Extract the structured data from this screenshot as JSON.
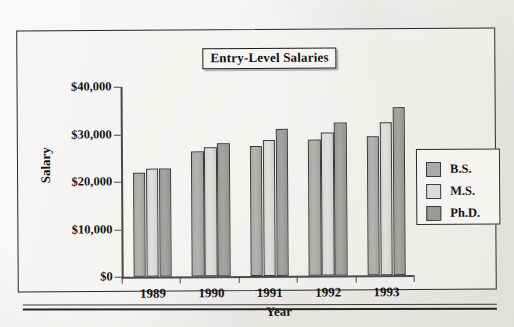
{
  "figure": {
    "title": "Entry-Level Salaries"
  },
  "chart_data": {
    "type": "bar",
    "title": "Entry-Level Salaries",
    "xlabel": "Year",
    "ylabel": "Salary",
    "categories": [
      "1989",
      "1990",
      "1991",
      "1992",
      "1993"
    ],
    "ylim": [
      0,
      40000
    ],
    "ytick_values": [
      0,
      10000,
      20000,
      30000,
      40000
    ],
    "ytick_labels": [
      "$0",
      "$10,000",
      "$20,000",
      "$30,000",
      "$40,000"
    ],
    "grid": false,
    "legend_position": "right",
    "series": [
      {
        "name": "B.S.",
        "color": "#aaaaa7",
        "values": [
          22000,
          26300,
          27400,
          28600,
          29300
        ]
      },
      {
        "name": "M.S.",
        "color": "#dedcd8",
        "values": [
          22700,
          27100,
          28700,
          30200,
          32300
        ]
      },
      {
        "name": "Ph.D.",
        "color": "#9a9a97",
        "values": [
          22700,
          28000,
          30900,
          32200,
          35300
        ]
      }
    ]
  },
  "legend": {
    "entries": [
      {
        "label": "B.S."
      },
      {
        "label": "M.S."
      },
      {
        "label": "Ph.D."
      }
    ]
  }
}
